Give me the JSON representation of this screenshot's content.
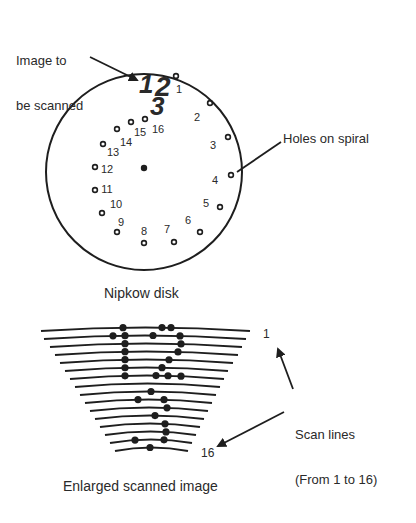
{
  "labels": {
    "image_to_be_scanned_line1": "Image to",
    "image_to_be_scanned_line2": "be scanned",
    "holes_on_spiral": "Holes on spiral",
    "nipkow_disk": "Nipkow disk",
    "scan_lines_line1": "Scan lines",
    "scan_lines_line2": "(From 1 to 16)",
    "enlarged_scanned_image": "Enlarged scanned image",
    "first_line_number": "1",
    "last_line_number": "16"
  },
  "scanned_image_glyphs": [
    "1",
    "2",
    "3"
  ],
  "disk": {
    "center": [
      144,
      172
    ],
    "radius": 98,
    "center_hole": [
      144,
      168
    ],
    "holes": [
      {
        "n": "1",
        "hole": [
          176,
          76
        ],
        "label": [
          179,
          93
        ]
      },
      {
        "n": "2",
        "hole": [
          210,
          103
        ],
        "label": [
          197,
          121
        ]
      },
      {
        "n": "3",
        "hole": [
          228,
          137
        ],
        "label": [
          213,
          149
        ]
      },
      {
        "n": "4",
        "hole": [
          231,
          175
        ],
        "label": [
          215,
          184
        ]
      },
      {
        "n": "5",
        "hole": [
          220,
          207
        ],
        "label": [
          206,
          207
        ]
      },
      {
        "n": "6",
        "hole": [
          200,
          232
        ],
        "label": [
          188,
          224
        ]
      },
      {
        "n": "7",
        "hole": [
          174,
          242
        ],
        "label": [
          167,
          233
        ]
      },
      {
        "n": "8",
        "hole": [
          144,
          243
        ],
        "label": [
          144,
          235
        ]
      },
      {
        "n": "9",
        "hole": [
          117,
          232
        ],
        "label": [
          121,
          226
        ]
      },
      {
        "n": "10",
        "hole": [
          102,
          213
        ],
        "label": [
          116,
          208
        ]
      },
      {
        "n": "11",
        "hole": [
          95,
          190
        ],
        "label": [
          107,
          193
        ]
      },
      {
        "n": "12",
        "hole": [
          95,
          167
        ],
        "label": [
          107,
          173
        ]
      },
      {
        "n": "13",
        "hole": [
          103,
          144
        ],
        "label": [
          113,
          156
        ]
      },
      {
        "n": "14",
        "hole": [
          117,
          129
        ],
        "label": [
          126,
          146
        ]
      },
      {
        "n": "15",
        "hole": [
          131,
          122
        ],
        "label": [
          140,
          136
        ]
      },
      {
        "n": "16",
        "hole": [
          145,
          119
        ],
        "label": [
          158,
          133
        ]
      }
    ]
  },
  "scan_lines": {
    "count": 16,
    "rows": [
      {
        "line": 1,
        "x1": 41,
        "x2": 250,
        "y": 328,
        "dots": [
          123,
          162,
          171
        ]
      },
      {
        "line": 2,
        "x1": 44,
        "x2": 246,
        "y": 336,
        "dots": [
          113,
          125,
          153,
          180
        ]
      },
      {
        "line": 3,
        "x1": 50,
        "x2": 242,
        "y": 344,
        "dots": [
          125,
          181
        ]
      },
      {
        "line": 4,
        "x1": 55,
        "x2": 238,
        "y": 352,
        "dots": [
          125,
          178
        ]
      },
      {
        "line": 5,
        "x1": 60,
        "x2": 233,
        "y": 360,
        "dots": [
          125,
          169
        ]
      },
      {
        "line": 6,
        "x1": 65,
        "x2": 228,
        "y": 368,
        "dots": [
          125,
          162
        ]
      },
      {
        "line": 7,
        "x1": 70,
        "x2": 224,
        "y": 376,
        "dots": [
          125,
          156,
          168,
          181
        ]
      },
      {
        "line": 8,
        "x1": 75,
        "x2": 220,
        "y": 384,
        "dots": []
      },
      {
        "line": 9,
        "x1": 80,
        "x2": 216,
        "y": 392,
        "dots": [
          151
        ]
      },
      {
        "line": 10,
        "x1": 85,
        "x2": 212,
        "y": 400,
        "dots": [
          138,
          164
        ]
      },
      {
        "line": 11,
        "x1": 90,
        "x2": 208,
        "y": 408,
        "dots": [
          167
        ]
      },
      {
        "line": 12,
        "x1": 95,
        "x2": 204,
        "y": 416,
        "dots": [
          155
        ]
      },
      {
        "line": 13,
        "x1": 100,
        "x2": 200,
        "y": 424,
        "dots": [
          165
        ]
      },
      {
        "line": 14,
        "x1": 105,
        "x2": 196,
        "y": 432,
        "dots": [
          166
        ]
      },
      {
        "line": 15,
        "x1": 110,
        "x2": 192,
        "y": 440,
        "dots": [
          135,
          164
        ]
      },
      {
        "line": 16,
        "x1": 115,
        "x2": 188,
        "y": 448,
        "dots": [
          150
        ]
      }
    ]
  },
  "colors": {
    "ink": "#1e1e1e",
    "text": "#2a2a2a",
    "background": "#ffffff"
  }
}
